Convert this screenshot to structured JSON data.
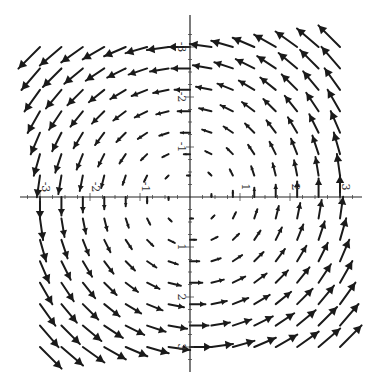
{
  "chart_data": {
    "type": "vector_field",
    "title": "",
    "field": {
      "u": "-y",
      "v": "x",
      "description": "counterclockwise rotational field F(x,y) = (-y, x)"
    },
    "xlim": [
      -3.4,
      3.4
    ],
    "ylim": [
      -3.4,
      3.4
    ],
    "grid": {
      "n_per_side": 7,
      "spacing": 0.4286,
      "includes_axes": true
    },
    "x_ticks": [
      -3,
      -2,
      -1,
      1,
      2,
      3
    ],
    "y_ticks": [
      -3,
      -2,
      -1,
      1,
      2,
      3
    ],
    "x_tick_labels": [
      "3",
      "2",
      "1",
      "1",
      "2",
      "3"
    ],
    "y_tick_labels": [
      "3",
      "2",
      "1",
      "1",
      "2",
      "3"
    ],
    "labels_rotated_deg": 90,
    "xlabel": "",
    "ylabel": "",
    "legend": null,
    "grid_lines": false
  },
  "layout": {
    "origin_px": [
      190,
      197
    ],
    "unit_px": 50,
    "x_axis_px": [
      20,
      362
    ],
    "y_axis_px": [
      15,
      372
    ],
    "arrow_scale_px_per_unit": 7.2,
    "colors": {
      "arrow": "#1a1a1a",
      "axis": "#222222",
      "label": "#333333",
      "background": "#ffffff"
    }
  }
}
